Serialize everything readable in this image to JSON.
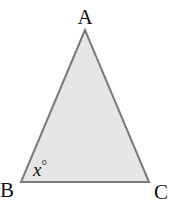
{
  "diagram": {
    "type": "triangle",
    "fill_color": "#e6e6e6",
    "stroke_color": "#7a7a7a",
    "vertices": [
      {
        "name": "A",
        "label": "A"
      },
      {
        "name": "B",
        "label": "B"
      },
      {
        "name": "C",
        "label": "C"
      }
    ],
    "angle_label": {
      "at_vertex": "B",
      "variable": "x",
      "degree_symbol": "°"
    }
  }
}
